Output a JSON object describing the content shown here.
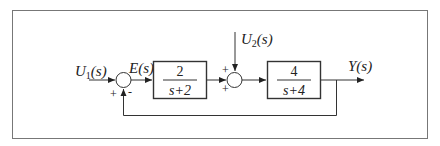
{
  "diagram": {
    "type": "block-diagram",
    "inputs": {
      "u1": {
        "label": "U",
        "subscript": "1",
        "arg": "(s)"
      },
      "u2": {
        "label": "U",
        "subscript": "2",
        "arg": "(s)"
      }
    },
    "error_signal": "E(s)",
    "output": "Y(s)",
    "summing_junction_1": {
      "plus_sign": "+",
      "minus_sign": "-"
    },
    "summing_junction_2": {
      "top_sign": "+",
      "left_sign": "+"
    },
    "block_1": {
      "numerator": "2",
      "denominator": "s+2"
    },
    "block_2": {
      "numerator": "4",
      "denominator": "s+4"
    },
    "feedback": "unity negative feedback from Y(s) to first summing junction"
  }
}
